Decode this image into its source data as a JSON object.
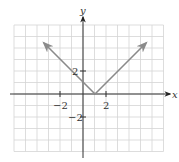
{
  "chart_data": {
    "type": "line",
    "title": "",
    "function": "y = |x - 1|",
    "xlabel": "x",
    "ylabel": "y",
    "xlim": [
      -6,
      7
    ],
    "ylim": [
      -5,
      6
    ],
    "grid": true,
    "tick_labels": {
      "x": [
        "-2",
        "2"
      ],
      "y": [
        "2",
        "-2"
      ]
    },
    "series": [
      {
        "name": "y=|x-1|",
        "points": [
          [
            -3.4,
            4.4
          ],
          [
            1,
            0
          ],
          [
            5.4,
            4.4
          ]
        ],
        "vertex": [
          1,
          0
        ],
        "arrows": "both ends",
        "color": "#8a8a8a"
      }
    ]
  },
  "labels": {
    "x_axis": "x",
    "y_axis": "y",
    "x_tick_neg2": "−2",
    "x_tick_pos2": "2",
    "y_tick_pos2": "2",
    "y_tick_neg2": "−2"
  }
}
